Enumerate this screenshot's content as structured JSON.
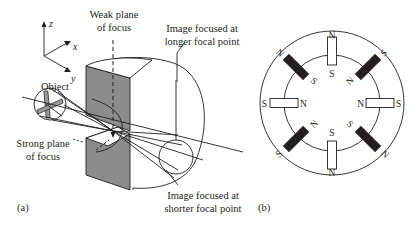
{
  "figure": {
    "panel_a": {
      "label": "(a)",
      "axes": {
        "z": "z",
        "x": "x",
        "y": "y"
      },
      "labels": {
        "weak_plane_line1": "Weak plane",
        "weak_plane_line2": "of focus",
        "longer_line1": "Image focused at",
        "longer_line2": "longer focal point",
        "object": "Object",
        "strong_plane_line1": "Strong plane",
        "strong_plane_line2": "of focus",
        "shorter_line1": "Image focused at",
        "shorter_line2": "shorter focal point"
      }
    },
    "panel_b": {
      "label": "(b)",
      "magnets": [
        {
          "position": "top",
          "outer_pole": "N",
          "inner_pole": "S",
          "fill": "white"
        },
        {
          "position": "top-right",
          "outer_pole": "S",
          "inner_pole": "N",
          "fill": "black"
        },
        {
          "position": "right",
          "outer_pole": "S",
          "inner_pole": "N",
          "fill": "white"
        },
        {
          "position": "bottom-right",
          "outer_pole": "N",
          "inner_pole": "S",
          "fill": "black"
        },
        {
          "position": "bottom",
          "outer_pole": "N",
          "inner_pole": "S",
          "fill": "white"
        },
        {
          "position": "bottom-left",
          "outer_pole": "S",
          "inner_pole": "N",
          "fill": "black"
        },
        {
          "position": "left",
          "outer_pole": "S",
          "inner_pole": "N",
          "fill": "white"
        },
        {
          "position": "top-left",
          "outer_pole": "N",
          "inner_pole": "S",
          "fill": "black"
        }
      ]
    }
  }
}
